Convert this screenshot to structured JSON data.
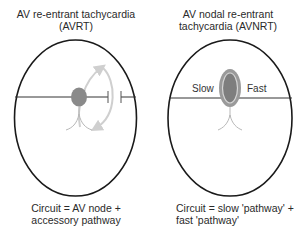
{
  "panels": [
    {
      "title_line1": "AV re-entrant tachycardia",
      "title_line2": "(AVRT)",
      "caption_line1": "Circuit = AV node +",
      "caption_line2": "accessory pathway"
    },
    {
      "title_line1": "AV nodal re-entrant",
      "title_line2": "tachycardia (AVNRT)",
      "slow_label": "Slow",
      "fast_label": "Fast",
      "caption_line1": "Circuit = slow 'pathway' +",
      "caption_line2": "fast 'pathway'"
    }
  ],
  "colors": {
    "outline": "#1a1a1a",
    "node_fill": "#8a8a8a",
    "circuit_arrow": "#cfcfcf",
    "bundle": "#b8b8b8"
  }
}
